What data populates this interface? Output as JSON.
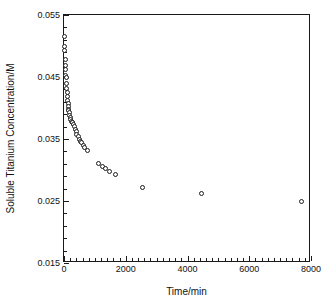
{
  "chart_data": {
    "type": "scatter",
    "title": "",
    "xlabel": "Time/min",
    "ylabel": "Soluble Titanium Concentration/M",
    "xlim": [
      0,
      8000
    ],
    "ylim": [
      0.015,
      0.055
    ],
    "grid": false,
    "legend": null,
    "x_ticks": [
      0,
      2000,
      4000,
      6000,
      8000
    ],
    "x_tick_labels": [
      "0",
      "2000",
      "4000",
      "6000",
      "8000"
    ],
    "x_minor_tick_step": 200,
    "y_ticks": [
      0.015,
      0.025,
      0.035,
      0.045,
      0.055
    ],
    "y_tick_labels": [
      "0.015",
      "0.025",
      "0.035",
      "0.045",
      "0.055"
    ],
    "y_minor_tick_step": 0.002,
    "marker": "open-circle",
    "marker_color": "#1c1c1c",
    "marker_fill": "#ffffff",
    "series": [
      {
        "name": "Soluble Titanium",
        "points": [
          [
            5,
            0.0515
          ],
          [
            15,
            0.05
          ],
          [
            25,
            0.0492
          ],
          [
            35,
            0.0478
          ],
          [
            45,
            0.0468
          ],
          [
            55,
            0.0462
          ],
          [
            60,
            0.0452
          ],
          [
            70,
            0.045
          ],
          [
            80,
            0.044
          ],
          [
            90,
            0.0432
          ],
          [
            100,
            0.0425
          ],
          [
            110,
            0.0418
          ],
          [
            120,
            0.0412
          ],
          [
            130,
            0.0407
          ],
          [
            140,
            0.0402
          ],
          [
            150,
            0.0398
          ],
          [
            160,
            0.0396
          ],
          [
            175,
            0.0392
          ],
          [
            190,
            0.0388
          ],
          [
            205,
            0.0384
          ],
          [
            220,
            0.0381
          ],
          [
            240,
            0.0379
          ],
          [
            260,
            0.0377
          ],
          [
            280,
            0.0376
          ],
          [
            300,
            0.0374
          ],
          [
            330,
            0.037
          ],
          [
            360,
            0.0366
          ],
          [
            390,
            0.0362
          ],
          [
            420,
            0.0358
          ],
          [
            455,
            0.0354
          ],
          [
            490,
            0.035
          ],
          [
            530,
            0.0346
          ],
          [
            570,
            0.0344
          ],
          [
            620,
            0.034
          ],
          [
            680,
            0.0336
          ],
          [
            760,
            0.0332
          ],
          [
            1120,
            0.031
          ],
          [
            1240,
            0.0306
          ],
          [
            1350,
            0.0302
          ],
          [
            1460,
            0.0298
          ],
          [
            1680,
            0.0292
          ],
          [
            2550,
            0.0272
          ],
          [
            4450,
            0.0262
          ],
          [
            7700,
            0.025
          ]
        ]
      }
    ]
  }
}
